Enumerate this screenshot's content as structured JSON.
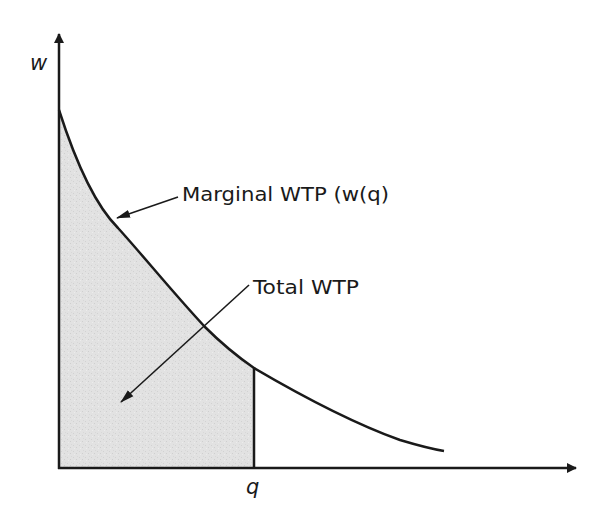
{
  "diagram": {
    "y_axis_label": "w",
    "x_axis_label": "q",
    "curve_label": "Marginal WTP (w(q)",
    "area_label": "Total WTP",
    "colors": {
      "line": "#1a1a1a",
      "fill": "#e2e2e2",
      "background": "#ffffff"
    }
  }
}
